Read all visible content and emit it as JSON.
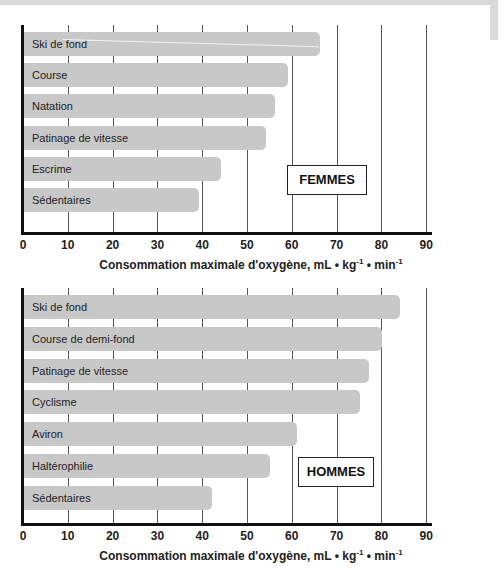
{
  "chart_data": [
    {
      "type": "bar",
      "orientation": "horizontal",
      "title": "FEMMES",
      "categories": [
        "Ski de fond",
        "Course",
        "Natation",
        "Patinage de vitesse",
        "Escrime",
        "Sédentaires"
      ],
      "values": [
        66,
        59,
        56,
        54,
        44,
        39
      ],
      "xlabel": "Consommation maximale d'oxygène, mL • kg-1 • min-1",
      "ylabel": "",
      "xlim": [
        0,
        90
      ],
      "xticks": [
        0,
        10,
        20,
        30,
        40,
        50,
        60,
        70,
        80,
        90
      ],
      "grid": true,
      "legend_position": "inside-right"
    },
    {
      "type": "bar",
      "orientation": "horizontal",
      "title": "HOMMES",
      "categories": [
        "Ski de fond",
        "Course de demi-fond",
        "Patinage de vitesse",
        "Cyclisme",
        "Aviron",
        "Haltérophilie",
        "Sédentaires"
      ],
      "values": [
        84,
        80,
        77,
        75,
        61,
        55,
        42
      ],
      "xlabel": "Consommation maximale d'oxygène, mL • kg-1 • min-1",
      "ylabel": "",
      "xlim": [
        0,
        90
      ],
      "xticks": [
        0,
        10,
        20,
        30,
        40,
        50,
        60,
        70,
        80,
        90
      ],
      "grid": true,
      "legend_position": "inside-right"
    }
  ],
  "labels": {
    "xlabel_main": "Consommation maximale d'oxygène, mL • kg",
    "xlabel_sup1": "-1",
    "xlabel_mid": " • min",
    "xlabel_sup2": "-1"
  },
  "colors": {
    "bar": "#c8c8c8",
    "axis": "#111111",
    "grid": "#555555"
  }
}
